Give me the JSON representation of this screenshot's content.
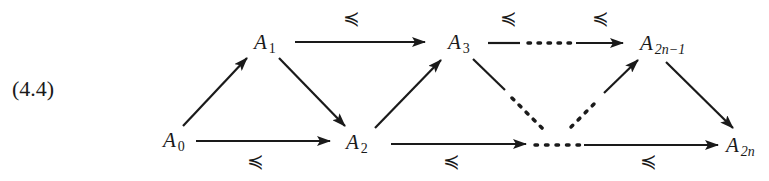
{
  "equation_number": "(4.4)",
  "nodes": {
    "a0": {
      "base": "A",
      "sub": "0"
    },
    "a1": {
      "base": "A",
      "sub": "1"
    },
    "a2": {
      "base": "A",
      "sub": "2"
    },
    "a3": {
      "base": "A",
      "sub": "3"
    },
    "a2n1": {
      "base": "A",
      "sub": "2n−1"
    },
    "a2n": {
      "base": "A",
      "sub": "2n"
    }
  },
  "relation_symbol": "≼",
  "edges": [
    {
      "from": "A0",
      "to": "A1",
      "style": "solid"
    },
    {
      "from": "A1",
      "to": "A2",
      "style": "solid"
    },
    {
      "from": "A0",
      "to": "A2",
      "style": "solid",
      "label": "≼"
    },
    {
      "from": "A1",
      "to": "A3",
      "style": "solid",
      "label": "≼"
    },
    {
      "from": "A2",
      "to": "A3",
      "style": "solid"
    },
    {
      "from": "A3",
      "to": "A2n−1",
      "style": "dotted",
      "label": "≼"
    },
    {
      "from": "A2",
      "to": "…",
      "style": "solid",
      "label": "≼"
    },
    {
      "from": "A3",
      "to": "…",
      "style": "dotted"
    },
    {
      "from": "…",
      "to": "A2n−1",
      "style": "dotted"
    },
    {
      "from": "…",
      "to": "A2n",
      "style": "solid",
      "label": "≼"
    },
    {
      "from": "A2n−1",
      "to": "A2n",
      "style": "solid"
    }
  ]
}
